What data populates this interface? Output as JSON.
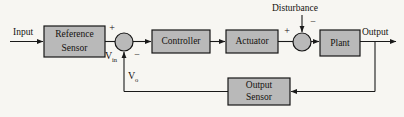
{
  "diagram": {
    "type": "block-diagram",
    "background_color": "#f7f6f2",
    "block_fill": "#b9b9b9",
    "block_stroke": "#161616",
    "line_color": "#1a1a1a",
    "text_color": "#14120f",
    "blocks": [
      {
        "id": "reference-sensor",
        "label_line1": "Reference",
        "label_line2": "Sensor",
        "x": 44,
        "y": 26,
        "w": 61,
        "h": 31
      },
      {
        "id": "controller",
        "label_line1": "Controller",
        "label_line2": "",
        "x": 152,
        "y": 30,
        "w": 58,
        "h": 23
      },
      {
        "id": "actuator",
        "label_line1": "Actuator",
        "label_line2": "",
        "x": 226,
        "y": 30,
        "w": 52,
        "h": 23
      },
      {
        "id": "plant",
        "label_line1": "Plant",
        "label_line2": "",
        "x": 320,
        "y": 30,
        "w": 40,
        "h": 26
      },
      {
        "id": "output-sensor",
        "label_line1": "Output",
        "label_line2": "Sensor",
        "x": 228,
        "y": 78,
        "w": 62,
        "h": 27
      }
    ],
    "junctions": [
      {
        "id": "error-summing-junction",
        "cx": 124,
        "cy": 42,
        "r": 9
      },
      {
        "id": "disturbance-summing-junction",
        "cx": 302,
        "cy": 42,
        "r": 9
      }
    ],
    "signal_labels": {
      "input": "Input",
      "output": "Output",
      "disturbance": "Disturbance",
      "v_in_base": "V",
      "v_in_sub": "in",
      "v_o_base": "V",
      "v_o_sub": "o"
    },
    "signs": {
      "error_plus": "+",
      "error_minus": "−",
      "disturbance_plus": "+",
      "disturbance_minus": "−"
    }
  }
}
